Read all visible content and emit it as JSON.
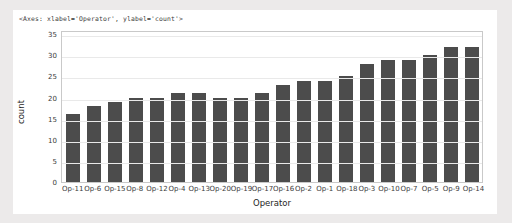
{
  "repr_header": "<Axes: xlabel='Operator', ylabel='count'>",
  "chart_data": {
    "type": "bar",
    "title": "",
    "xlabel": "Operator",
    "ylabel": "count",
    "categories": [
      "Op-11",
      "Op-6",
      "Op-15",
      "Op-8",
      "Op-12",
      "Op-4",
      "Op-13",
      "Op-20",
      "Op-19",
      "Op-17",
      "Op-16",
      "Op-2",
      "Op-1",
      "Op-18",
      "Op-3",
      "Op-10",
      "Op-7",
      "Op-5",
      "Op-9",
      "Op-14"
    ],
    "values": [
      16,
      18,
      19,
      20,
      20,
      21,
      21,
      20,
      20,
      21,
      23,
      24,
      24,
      25,
      28,
      29,
      29,
      30,
      32,
      32
    ],
    "ylim": [
      0,
      36
    ],
    "yticks": [
      0,
      5,
      10,
      15,
      20,
      25,
      30,
      35
    ],
    "grid": true,
    "legend": false,
    "bar_color": "#4c4c4c",
    "background": "#ffffff",
    "page_background": "#eceaea"
  }
}
